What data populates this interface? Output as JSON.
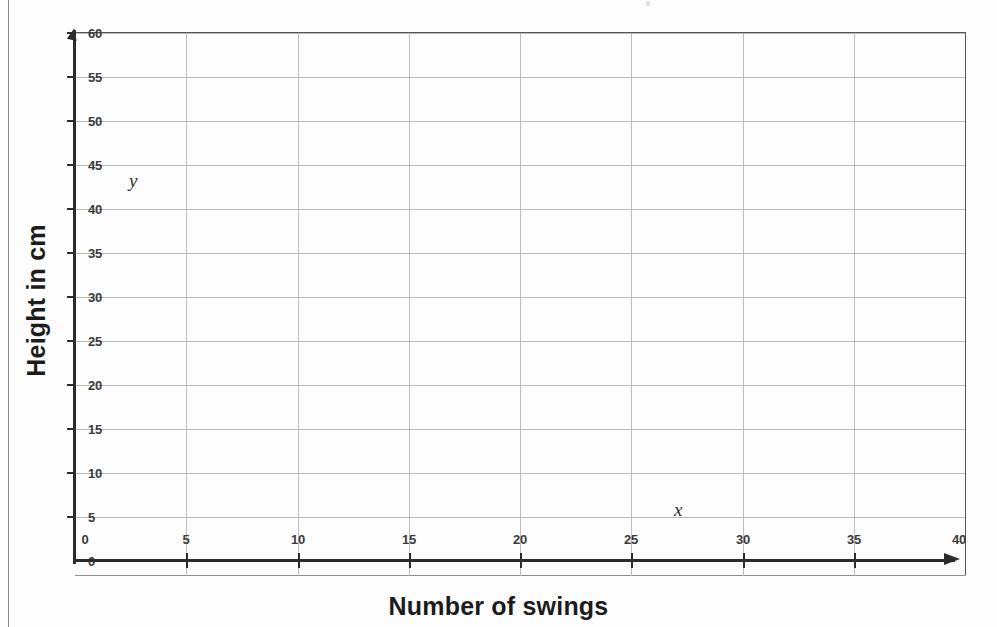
{
  "chart_data": {
    "type": "line",
    "title": "",
    "xlabel": "Number of swings",
    "ylabel": "Height in cm",
    "xlim": [
      0,
      40
    ],
    "ylim": [
      0,
      60
    ],
    "x_ticks": [
      0,
      5,
      10,
      15,
      20,
      25,
      30,
      35,
      40
    ],
    "y_ticks": [
      0,
      5,
      10,
      15,
      20,
      25,
      30,
      35,
      40,
      45,
      50,
      55,
      60
    ],
    "x_tick_labels": [
      "0",
      "5",
      "10",
      "15",
      "20",
      "25",
      "30",
      "35",
      "40"
    ],
    "y_tick_labels": [
      "0",
      "5",
      "10",
      "15",
      "20",
      "25",
      "30",
      "35",
      "40",
      "45",
      "50",
      "55",
      "60"
    ],
    "x_axis_variable": "x",
    "y_axis_variable": "y",
    "grid": true,
    "legend": null,
    "series": [],
    "values": [],
    "note": "Empty grid / blank graph paper — no data plotted"
  },
  "axis_titles": {
    "x": "Number of swings",
    "y": "Height in cm"
  },
  "variables": {
    "x": "x",
    "y": "y"
  }
}
